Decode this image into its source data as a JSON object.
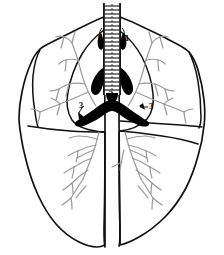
{
  "figure": {
    "view": "anterior",
    "style": "black-and-white line drawing",
    "background_color": "#ffffff",
    "outline_color": "#111111",
    "bronchi_color": "#9a9a9a",
    "solid_fill_color": "#000000"
  },
  "labels": [
    {
      "id": "label-1-left",
      "text": "1",
      "x": 99,
      "y": 41
    },
    {
      "id": "label-1-right",
      "text": "1",
      "x": 127,
      "y": 41
    },
    {
      "id": "label-2",
      "text": "2",
      "x": 111,
      "y": 97
    },
    {
      "id": "label-3-left",
      "text": "3",
      "x": 81,
      "y": 108
    },
    {
      "id": "label-3-right",
      "text": "3",
      "x": 151,
      "y": 109
    }
  ],
  "structures": {
    "trachea": "trachea-with-cartilage-rings",
    "carina": "carina-black-wedge",
    "main_bronchi": "primary-bronchi-black",
    "left_lung": "left-lung-outline",
    "right_lung": "right-lung-outline",
    "bronchial_tree": "segmental-bronchi-grey-branches"
  }
}
